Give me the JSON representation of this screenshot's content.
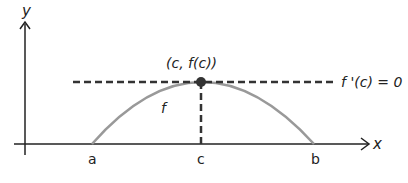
{
  "diagram": {
    "axes": {
      "x_label": "x",
      "y_label": "y"
    },
    "points": {
      "a": "a",
      "c": "c",
      "b": "b"
    },
    "curve_label": "f",
    "max_point_label": "(c, f(c))",
    "tangent_label": "f '(c) = 0",
    "colors": {
      "curve": "#999999",
      "axes": "#222222",
      "dashed": "#333333",
      "point": "#333333"
    }
  }
}
